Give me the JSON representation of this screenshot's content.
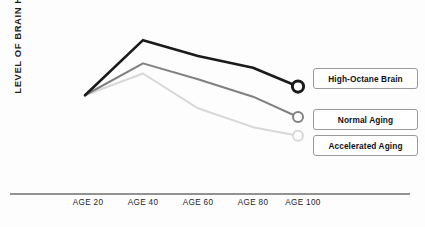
{
  "axes": {
    "ylabel": "LEVEL OF BRAIN HEALTH*",
    "xticks": [
      "AGE 20",
      "AGE 40",
      "AGE 60",
      "AGE 80",
      "AGE 100"
    ]
  },
  "legend": [
    {
      "label": "High-Octane Brain",
      "color": "#1a1a1a"
    },
    {
      "label": "Normal Aging",
      "color": "#808080"
    },
    {
      "label": "Accelerated Aging",
      "color": "#d8d8d8"
    }
  ],
  "chart_data": {
    "type": "line",
    "title": "",
    "xlabel": "",
    "ylabel": "LEVEL OF BRAIN HEALTH*",
    "categories": [
      "AGE 20",
      "AGE 40",
      "AGE 60",
      "AGE 80",
      "AGE 100"
    ],
    "x": [
      20,
      40,
      60,
      80,
      100
    ],
    "grid": false,
    "legend_position": "right-inline-labels",
    "ylim": [
      0,
      100
    ],
    "y_axis_ticks_shown": false,
    "series": [
      {
        "name": "High-Octane Brain",
        "color": "#1a1a1a",
        "values": [
          55,
          93,
          82,
          74,
          61
        ],
        "endpoint_marker": "open-circle-thick"
      },
      {
        "name": "Normal Aging",
        "color": "#808080",
        "values": [
          55,
          77,
          66,
          54,
          40
        ],
        "endpoint_marker": "open-circle"
      },
      {
        "name": "Accelerated Aging",
        "color": "#d8d8d8",
        "values": [
          55,
          70,
          46,
          33,
          27
        ],
        "endpoint_marker": "open-circle"
      }
    ]
  }
}
